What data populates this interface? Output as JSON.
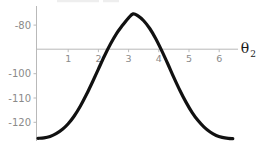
{
  "chart_data": {
    "type": "line",
    "title": "",
    "xlabel": "θ₂",
    "ylabel": "",
    "xlim": [
      -0.15,
      6.6
    ],
    "ylim": [
      -128.5,
      -72.0
    ],
    "grid": false,
    "legend": null,
    "xticks": [
      1,
      2,
      3,
      4,
      5,
      6
    ],
    "xtick_labels": [
      "1",
      "2",
      "3",
      "4",
      "5",
      "6"
    ],
    "yticks": [
      -80,
      -100,
      -110,
      -120
    ],
    "ytick_labels": [
      "-80",
      "-100",
      "-110",
      "-120"
    ],
    "axis_crossing_y": -90,
    "curve_description": "smooth unimodal cosine-like bump peaking near theta2 = 3.15",
    "series": [
      {
        "name": "curve",
        "color": "#111111",
        "line_width": 3.2,
        "x": [
          0.0,
          0.2,
          0.4,
          0.6,
          0.8,
          1.0,
          1.2,
          1.4,
          1.6,
          1.8,
          2.0,
          2.2,
          2.4,
          2.6,
          2.8,
          3.0,
          3.15,
          3.3,
          3.5,
          3.7,
          3.9,
          4.1,
          4.3,
          4.5,
          4.7,
          4.9,
          5.1,
          5.3,
          5.5,
          5.7,
          5.9,
          6.1,
          6.3,
          6.45
        ],
        "y": [
          -126.6,
          -126.4,
          -125.8,
          -124.7,
          -123.0,
          -120.6,
          -117.4,
          -113.4,
          -108.7,
          -103.5,
          -98.1,
          -92.7,
          -87.8,
          -83.5,
          -80.1,
          -77.0,
          -75.4,
          -76.1,
          -78.2,
          -81.4,
          -85.6,
          -90.6,
          -96.0,
          -101.6,
          -106.9,
          -111.7,
          -115.9,
          -119.3,
          -122.0,
          -124.0,
          -125.4,
          -126.2,
          -126.6,
          -126.7
        ]
      }
    ]
  },
  "labels": {
    "ytick_0": "-80",
    "ytick_1": "-100",
    "ytick_2": "-110",
    "ytick_3": "-120",
    "xtick_0": "1",
    "xtick_1": "2",
    "xtick_2": "3",
    "xtick_3": "4",
    "xtick_4": "5",
    "xtick_5": "6",
    "axis_label_main": "θ",
    "axis_label_subscript": "2"
  },
  "colors": {
    "curve": "#111111",
    "axis": "#b4b4b4",
    "tick_text": "#8a8a8a",
    "label_text": "#1a1a1a",
    "background": "#ffffff"
  }
}
